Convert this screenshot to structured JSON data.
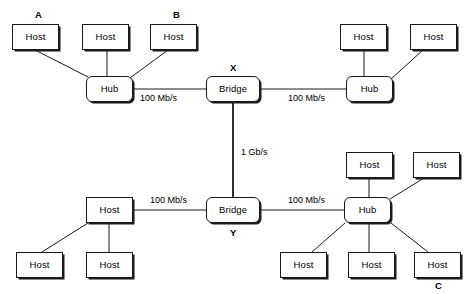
{
  "diagram": {
    "colors": {
      "background": "#ffffff",
      "stroke": "#1a1a1a",
      "text": "#000000",
      "shadow": "#1a1a1a"
    },
    "nodes": [
      {
        "id": "h1",
        "type": "host",
        "label": "Host",
        "x": 12,
        "y": 24
      },
      {
        "id": "h2",
        "type": "host",
        "label": "Host",
        "x": 82,
        "y": 24
      },
      {
        "id": "h3",
        "type": "host",
        "label": "Host",
        "x": 150,
        "y": 24
      },
      {
        "id": "hubA",
        "type": "hub",
        "label": "Hub",
        "x": 86,
        "y": 76
      },
      {
        "id": "brX",
        "type": "bridge",
        "label": "Bridge",
        "x": 206,
        "y": 76
      },
      {
        "id": "hubB",
        "type": "hub",
        "label": "Hub",
        "x": 346,
        "y": 76
      },
      {
        "id": "h4",
        "type": "host",
        "label": "Host",
        "x": 340,
        "y": 24
      },
      {
        "id": "h5",
        "type": "host",
        "label": "Host",
        "x": 410,
        "y": 24
      },
      {
        "id": "brY",
        "type": "bridge",
        "label": "Bridge",
        "x": 206,
        "y": 197
      },
      {
        "id": "hubC",
        "type": "hub",
        "label": "Hub",
        "x": 344,
        "y": 197
      },
      {
        "id": "h6",
        "type": "host",
        "label": "Host",
        "x": 86,
        "y": 197
      },
      {
        "id": "h7",
        "type": "host",
        "label": "Host",
        "x": 16,
        "y": 252
      },
      {
        "id": "h8",
        "type": "host",
        "label": "Host",
        "x": 86,
        "y": 252
      },
      {
        "id": "h9",
        "type": "host",
        "label": "Host",
        "x": 346,
        "y": 152
      },
      {
        "id": "h10",
        "type": "host",
        "label": "Host",
        "x": 413,
        "y": 152
      },
      {
        "id": "h11",
        "type": "host",
        "label": "Host",
        "x": 280,
        "y": 252
      },
      {
        "id": "h12",
        "type": "host",
        "label": "Host",
        "x": 348,
        "y": 252
      },
      {
        "id": "h13",
        "type": "host",
        "label": "Host",
        "x": 414,
        "y": 252
      }
    ],
    "group_labels": [
      {
        "id": "A",
        "text": "A",
        "x": 35,
        "y": 10
      },
      {
        "id": "B",
        "text": "B",
        "x": 173,
        "y": 10
      },
      {
        "id": "X",
        "text": "X",
        "x": 230,
        "y": 63
      },
      {
        "id": "Y",
        "text": "Y",
        "x": 230,
        "y": 228
      },
      {
        "id": "C",
        "text": "C",
        "x": 435,
        "y": 281
      }
    ],
    "link_labels": [
      {
        "id": "rate-hubA-brX",
        "text": "100 Mb/s",
        "x": 140,
        "y": 94
      },
      {
        "id": "rate-brX-hubB",
        "text": "100 Mb/s",
        "x": 288,
        "y": 94
      },
      {
        "id": "rate-brX-brY",
        "text": "1 Gb/s",
        "x": 241,
        "y": 148
      },
      {
        "id": "rate-hub6-brY",
        "text": "100 Mb/s",
        "x": 150,
        "y": 196
      },
      {
        "id": "rate-brY-hubC",
        "text": "100 Mb/s",
        "x": 288,
        "y": 196
      }
    ],
    "links": [
      {
        "id": "l1",
        "from": "h1",
        "to": "hubA",
        "x1": 35,
        "y1": 50,
        "x2": 88,
        "y2": 77,
        "rate": ""
      },
      {
        "id": "l2",
        "from": "h2",
        "to": "hubA",
        "x1": 107,
        "y1": 50,
        "x2": 107,
        "y2": 76,
        "rate": ""
      },
      {
        "id": "l3",
        "from": "h3",
        "to": "hubA",
        "x1": 168,
        "y1": 50,
        "x2": 130,
        "y2": 78,
        "rate": ""
      },
      {
        "id": "l4",
        "from": "hubA",
        "to": "brX",
        "x1": 133,
        "y1": 89,
        "x2": 206,
        "y2": 89,
        "rate": "100 Mb/s"
      },
      {
        "id": "l5",
        "from": "brX",
        "to": "hubB",
        "x1": 260,
        "y1": 89,
        "x2": 346,
        "y2": 89,
        "rate": "100 Mb/s"
      },
      {
        "id": "l6",
        "from": "h4",
        "to": "hubB",
        "x1": 364,
        "y1": 50,
        "x2": 364,
        "y2": 76,
        "rate": ""
      },
      {
        "id": "l7",
        "from": "h5",
        "to": "hubB",
        "x1": 423,
        "y1": 50,
        "x2": 390,
        "y2": 80,
        "rate": ""
      },
      {
        "id": "l8",
        "from": "brX",
        "to": "brY",
        "x1": 233,
        "y1": 102,
        "x2": 233,
        "y2": 197,
        "rate": "1 Gb/s"
      },
      {
        "id": "l9",
        "from": "h6",
        "to": "brY",
        "x1": 133,
        "y1": 210,
        "x2": 206,
        "y2": 210,
        "rate": "100 Mb/s"
      },
      {
        "id": "l10",
        "from": "brY",
        "to": "hubC",
        "x1": 260,
        "y1": 210,
        "x2": 344,
        "y2": 210,
        "rate": "100 Mb/s"
      },
      {
        "id": "l11",
        "from": "h7",
        "to": "h6",
        "x1": 42,
        "y1": 252,
        "x2": 88,
        "y2": 223,
        "rate": ""
      },
      {
        "id": "l12",
        "from": "h8",
        "to": "h6",
        "x1": 109,
        "y1": 252,
        "x2": 109,
        "y2": 223,
        "rate": ""
      },
      {
        "id": "l13",
        "from": "h9",
        "to": "hubC",
        "x1": 369,
        "y1": 178,
        "x2": 369,
        "y2": 197,
        "rate": ""
      },
      {
        "id": "l14",
        "from": "h10",
        "to": "hubC",
        "x1": 424,
        "y1": 178,
        "x2": 390,
        "y2": 199,
        "rate": ""
      },
      {
        "id": "l15",
        "from": "h11",
        "to": "hubC",
        "x1": 312,
        "y1": 252,
        "x2": 345,
        "y2": 223,
        "rate": ""
      },
      {
        "id": "l16",
        "from": "h12",
        "to": "hubC",
        "x1": 369,
        "y1": 252,
        "x2": 369,
        "y2": 223,
        "rate": ""
      },
      {
        "id": "l17",
        "from": "h13",
        "to": "hubC",
        "x1": 428,
        "y1": 252,
        "x2": 391,
        "y2": 223,
        "rate": ""
      }
    ]
  }
}
